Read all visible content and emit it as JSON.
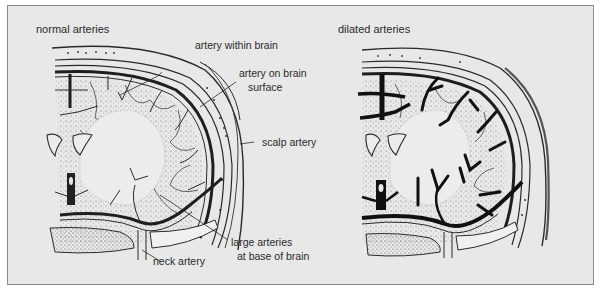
{
  "panels": [
    {
      "title": "normal arteries",
      "labels": {
        "artery_within_brain": "artery within brain",
        "artery_on_brain_surface_1": "artery on brain",
        "artery_on_brain_surface_2": "surface",
        "scalp_artery": "scalp artery",
        "large_arteries_1": "large arteries",
        "large_arteries_2": "at base of brain",
        "neck_artery": "neck artery"
      }
    },
    {
      "title": "dilated arteries"
    }
  ],
  "colors": {
    "background": "#e8e8e8",
    "frame_border": "#8a8a8a",
    "ink": "#2a2a2a",
    "stipple": "#7a7a7a"
  }
}
